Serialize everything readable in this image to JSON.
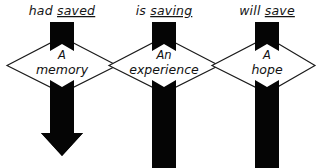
{
  "diagram": {
    "background_color": "#ffffff",
    "ink_color": "#050505",
    "outline_color": "#1a1a1a",
    "canvas": {
      "width": 322,
      "height": 168
    },
    "columns": [
      {
        "id": "past",
        "label_prefix": "had ",
        "label_underlined": "saved",
        "label_full": "had saved",
        "node_line_1": "A",
        "node_line_2": "memory",
        "bar_has_arrowhead": true,
        "center_x": 62
      },
      {
        "id": "present",
        "label_prefix": "is ",
        "label_underlined": "saving",
        "label_full": "is saving",
        "node_line_1": "An",
        "node_line_2": "experience",
        "bar_has_arrowhead": false,
        "center_x": 164
      },
      {
        "id": "future",
        "label_prefix": "will ",
        "label_underlined": "save",
        "label_full": "will save",
        "node_line_1": "A",
        "node_line_2": "hope",
        "bar_has_arrowhead": false,
        "center_x": 267
      }
    ]
  }
}
